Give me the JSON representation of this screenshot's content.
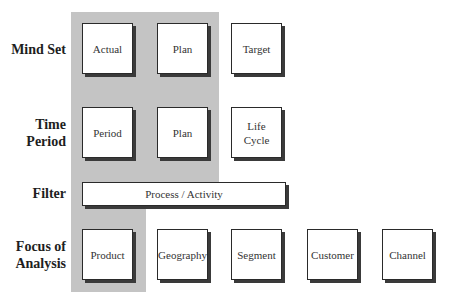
{
  "colors": {
    "highlight_band": "#c4c4c4",
    "box_border": "#2a2a2a",
    "box_fill": "#ffffff"
  },
  "rows": {
    "mind_set": {
      "label": "Mind Set",
      "boxes": [
        "Actual",
        "Plan",
        "Target"
      ]
    },
    "time_period": {
      "label_line1": "Time",
      "label_line2": "Period",
      "boxes": [
        "Period",
        "Plan"
      ],
      "life_cycle_line1": "Life",
      "life_cycle_line2": "Cycle"
    },
    "filter": {
      "label": "Filter",
      "bar": "Process / Activity"
    },
    "focus": {
      "label_line1": "Focus of",
      "label_line2": "Analysis",
      "boxes": [
        "Product",
        "Geography",
        "Segment",
        "Customer",
        "Channel"
      ]
    }
  }
}
